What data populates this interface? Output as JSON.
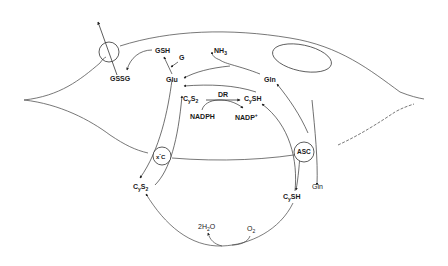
{
  "diagram": {
    "type": "cell metabolism pathway",
    "colors": {
      "line": "#333333",
      "membrane": "#555555",
      "text": "#1a1a1a"
    },
    "transporters": [
      {
        "id": "gssg-exporter",
        "label": ""
      },
      {
        "id": "xc",
        "label": "xc⁻"
      },
      {
        "id": "asc",
        "label": "ASC"
      }
    ],
    "labels": {
      "gsh": "GSH",
      "g": "G",
      "gssg": "GSSG",
      "nh3": "NH",
      "nh3_sub": "3",
      "glu": "Glu",
      "gln_in": "Gln",
      "cys2_in_c": "C",
      "cys2_in_y": "y",
      "cys2_in_s": "S",
      "cys2_in_2": "2",
      "dr": "DR",
      "cysh_in_c": "C",
      "cysh_in_y": "y",
      "cysh_in_sh": "SH",
      "nadph": "NADPH",
      "nadp": "NADP",
      "nadp_sup": "+",
      "xc_x": "x",
      "xc_c": "C",
      "xc_minus": "-",
      "asc": "ASC",
      "gln_out": "Gln",
      "cys2_out_c": "C",
      "cys2_out_y": "y",
      "cys2_out_s": "S",
      "cys2_out_2": "2",
      "cysh_out_c": "C",
      "cysh_out_y": "y",
      "cysh_out_sh": "SH",
      "h2o_2": "2H",
      "h2o_sub": "2",
      "h2o_o": "O",
      "o2": "O",
      "o2_sub": "2"
    }
  }
}
